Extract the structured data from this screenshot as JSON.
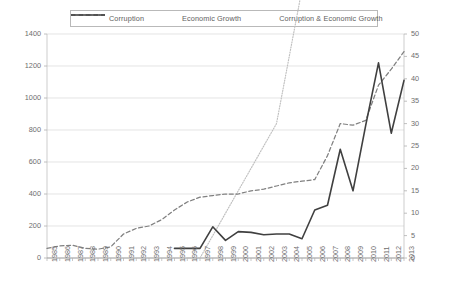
{
  "legend": {
    "position": "top-center",
    "entries": [
      {
        "label": "Corruption",
        "style": "dotted",
        "color": "#bfbfbf"
      },
      {
        "label": "Economic Growth",
        "style": "dashed",
        "color": "#808080"
      },
      {
        "label": "Corruption & Economic Growth",
        "style": "solid",
        "color": "#404040"
      }
    ]
  },
  "chart_data": {
    "type": "line",
    "title": "",
    "xlabel": "",
    "ylabel": "",
    "grid": true,
    "legend_position": "top",
    "ylim": [
      0,
      1400
    ],
    "y2lim": [
      0,
      50
    ],
    "yticks": [
      0,
      200,
      400,
      600,
      800,
      1000,
      1200,
      1400
    ],
    "y2ticks": [
      0,
      5,
      10,
      15,
      20,
      25,
      30,
      35,
      40,
      45,
      50
    ],
    "x": [
      1985,
      1986,
      1987,
      1988,
      1989,
      1990,
      1991,
      1992,
      1993,
      1994,
      1995,
      1996,
      1997,
      1998,
      1999,
      2000,
      2001,
      2002,
      2003,
      2004,
      2005,
      2006,
      2007,
      2008,
      2009,
      2010,
      2011,
      2012,
      2013
    ],
    "categories": [
      "1985",
      "1986",
      "1987",
      "1988",
      "1989",
      "1990",
      "1991",
      "1992",
      "1993",
      "1994",
      "1995",
      "1996",
      "1997",
      "1998",
      "1999",
      "2000",
      "2001",
      "2002",
      "2003",
      "2004",
      "2005",
      "2006",
      "2007",
      "2008",
      "2009",
      "2010",
      "2011",
      "2012",
      "2013"
    ],
    "series": [
      {
        "name": "Corruption",
        "style": "dotted",
        "color": "#bfbfbf",
        "axis": "right",
        "values": [
          null,
          null,
          null,
          null,
          null,
          null,
          null,
          null,
          null,
          null,
          null,
          0,
          0,
          5,
          10,
          15,
          20,
          25,
          30,
          45,
          60,
          110,
          180,
          190,
          195,
          200,
          215,
          240,
          280
        ]
      },
      {
        "name": "Economic Growth",
        "style": "dashed",
        "color": "#808080",
        "axis": "left",
        "values": [
          60,
          75,
          80,
          60,
          55,
          70,
          150,
          185,
          200,
          240,
          300,
          350,
          380,
          390,
          400,
          400,
          420,
          430,
          450,
          470,
          480,
          490,
          640,
          840,
          830,
          860,
          1080,
          1180,
          1290
        ]
      },
      {
        "name": "Corruption & Economic Growth",
        "style": "solid",
        "color": "#404040",
        "axis": "left",
        "values": [
          null,
          null,
          null,
          null,
          null,
          null,
          null,
          null,
          null,
          null,
          60,
          60,
          60,
          195,
          110,
          165,
          160,
          145,
          150,
          150,
          120,
          300,
          330,
          680,
          420,
          830,
          1220,
          780,
          1110
        ]
      }
    ]
  }
}
